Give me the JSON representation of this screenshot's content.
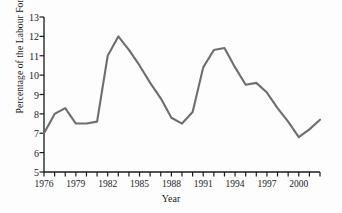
{
  "chart_data": {
    "type": "line",
    "title": "",
    "xlabel": "Year",
    "ylabel": "Percentage of the Labour Force",
    "xlim": [
      1976,
      2002
    ],
    "ylim": [
      5,
      13
    ],
    "grid": false,
    "legend": null,
    "line_color": "#6e6e6e",
    "axis_color": "#1a1a1a",
    "y_ticks": [
      5,
      6,
      7,
      8,
      9,
      10,
      11,
      12,
      13
    ],
    "x_ticks": [
      1976,
      1977,
      1978,
      1979,
      1980,
      1981,
      1982,
      1983,
      1984,
      1985,
      1986,
      1987,
      1988,
      1989,
      1990,
      1991,
      1992,
      1993,
      1994,
      1995,
      1996,
      1997,
      1998,
      1999,
      2000,
      2001,
      2002
    ],
    "x_tick_labels": [
      {
        "value": 1976,
        "label": "1976"
      },
      {
        "value": 1979,
        "label": "1979"
      },
      {
        "value": 1982,
        "label": "1982"
      },
      {
        "value": 1985,
        "label": "1985"
      },
      {
        "value": 1988,
        "label": "1988"
      },
      {
        "value": 1991,
        "label": "1991"
      },
      {
        "value": 1994,
        "label": "1994"
      },
      {
        "value": 1997,
        "label": "1997"
      },
      {
        "value": 2000,
        "label": "2000"
      }
    ],
    "x": [
      1976,
      1977,
      1978,
      1979,
      1980,
      1981,
      1982,
      1983,
      1984,
      1985,
      1986,
      1987,
      1988,
      1989,
      1990,
      1991,
      1992,
      1993,
      1994,
      1995,
      1996,
      1997,
      1998,
      1999,
      2000,
      2001,
      2002
    ],
    "values": [
      7.0,
      8.0,
      8.3,
      7.5,
      7.5,
      7.6,
      11.0,
      12.0,
      11.3,
      10.5,
      9.6,
      8.8,
      7.8,
      7.5,
      8.1,
      10.4,
      11.3,
      11.4,
      10.4,
      9.5,
      9.6,
      9.1,
      8.3,
      7.6,
      6.8,
      7.2,
      7.7
    ]
  }
}
